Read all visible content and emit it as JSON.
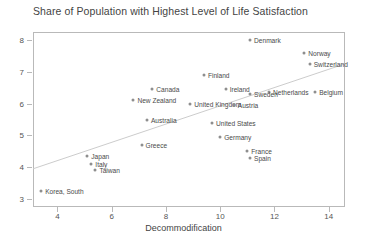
{
  "chart_data": {
    "type": "scatter",
    "title": "Share of Population with Highest Level of Life Satisfaction",
    "xlabel": "Decommodification",
    "ylabel": "",
    "xlim": [
      3.1,
      14.6
    ],
    "ylim": [
      2.75,
      8.25
    ],
    "xticks": [
      4,
      6,
      8,
      10,
      12,
      14
    ],
    "yticks": [
      3,
      4,
      5,
      6,
      7,
      8
    ],
    "grid": false,
    "legend": false,
    "trendline": {
      "x0": 3.1,
      "y0": 3.95,
      "x1": 14.6,
      "y1": 7.25
    },
    "points": [
      {
        "label": "Denmark",
        "x": 11.1,
        "y": 8.0,
        "lx": 4,
        "ly": 0
      },
      {
        "label": "Norway",
        "x": 13.1,
        "y": 7.6,
        "lx": 4,
        "ly": 0
      },
      {
        "label": "Switzerland",
        "x": 13.3,
        "y": 7.25,
        "lx": 4,
        "ly": 0
      },
      {
        "label": "Finland",
        "x": 9.4,
        "y": 6.9,
        "lx": 4,
        "ly": 0
      },
      {
        "label": "Belgium",
        "x": 13.5,
        "y": 6.35,
        "lx": 4,
        "ly": 0
      },
      {
        "label": "Canada",
        "x": 7.5,
        "y": 6.45,
        "lx": 4,
        "ly": 0
      },
      {
        "label": "Ireland",
        "x": 10.2,
        "y": 6.45,
        "lx": 4,
        "ly": 0
      },
      {
        "label": "Netherlands",
        "x": 11.8,
        "y": 6.35,
        "lx": 4,
        "ly": 0
      },
      {
        "label": "Sweden",
        "x": 11.1,
        "y": 6.3,
        "lx": 4,
        "ly": 0
      },
      {
        "label": "New Zealand",
        "x": 6.8,
        "y": 6.1,
        "lx": 4,
        "ly": 0
      },
      {
        "label": "United Kingdom",
        "x": 8.9,
        "y": 6.0,
        "lx": 4,
        "ly": 0
      },
      {
        "label": "Austria",
        "x": 10.5,
        "y": 5.95,
        "lx": 4,
        "ly": 0
      },
      {
        "label": "Australia",
        "x": 7.3,
        "y": 5.5,
        "lx": 4,
        "ly": 0
      },
      {
        "label": "United States",
        "x": 9.7,
        "y": 5.4,
        "lx": 4,
        "ly": 0
      },
      {
        "label": "Germany",
        "x": 10.0,
        "y": 4.95,
        "lx": 4,
        "ly": 0
      },
      {
        "label": "Greece",
        "x": 7.1,
        "y": 4.7,
        "lx": 4,
        "ly": 0
      },
      {
        "label": "France",
        "x": 11.0,
        "y": 4.5,
        "lx": 4,
        "ly": 0
      },
      {
        "label": "Spain",
        "x": 11.1,
        "y": 4.3,
        "lx": 4,
        "ly": 0
      },
      {
        "label": "Japan",
        "x": 5.1,
        "y": 4.35,
        "lx": 4,
        "ly": 0
      },
      {
        "label": "Italy",
        "x": 5.25,
        "y": 4.1,
        "lx": 4,
        "ly": 0
      },
      {
        "label": "Taiwan",
        "x": 5.4,
        "y": 3.9,
        "lx": 4,
        "ly": 0
      },
      {
        "label": "Korea, South",
        "x": 3.4,
        "y": 3.25,
        "lx": 4,
        "ly": 0
      }
    ]
  }
}
